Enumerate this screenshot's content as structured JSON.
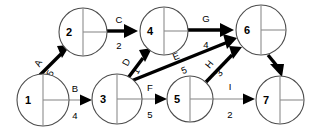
{
  "diagram": {
    "type": "directed-graph",
    "colors": {
      "background": "#ffffff",
      "node_stroke": "#4d4d4d",
      "node_fill": "#ffffff",
      "node_divider": "#8c8c8c",
      "edge_strong": "#000000",
      "edge_weak": "#b3b3b3",
      "text": "#000000"
    },
    "nodes": [
      {
        "id": "n1",
        "label": "1",
        "cx": 43,
        "cy": 100,
        "r": 26
      },
      {
        "id": "n2",
        "label": "2",
        "cx": 83,
        "cy": 32,
        "r": 24
      },
      {
        "id": "n3",
        "label": "3",
        "cx": 117,
        "cy": 99,
        "r": 25
      },
      {
        "id": "n4",
        "label": "4",
        "cx": 164,
        "cy": 31,
        "r": 24
      },
      {
        "id": "n5",
        "label": "5",
        "cx": 190,
        "cy": 99,
        "r": 23
      },
      {
        "id": "n6",
        "label": "6",
        "cx": 261,
        "cy": 30,
        "r": 25
      },
      {
        "id": "n7",
        "label": "7",
        "cx": 280,
        "cy": 100,
        "r": 24
      }
    ],
    "edges": [
      {
        "id": "e-a",
        "label": "A",
        "weight": "5",
        "from": "n1",
        "to": "n2",
        "emphasis": "strong"
      },
      {
        "id": "e-b",
        "label": "B",
        "weight": "4",
        "from": "n1",
        "to": "n3",
        "emphasis": "weak"
      },
      {
        "id": "e-c",
        "label": "C",
        "weight": "2",
        "from": "n2",
        "to": "n4",
        "emphasis": "strong"
      },
      {
        "id": "e-d",
        "label": "D",
        "weight": "1",
        "from": "n3",
        "to": "n4",
        "emphasis": "strong"
      },
      {
        "id": "e-e",
        "label": "E",
        "weight": "5",
        "from": "n3",
        "to": "n6",
        "emphasis": "strong"
      },
      {
        "id": "e-f",
        "label": "F",
        "weight": "5",
        "from": "n3",
        "to": "n5",
        "emphasis": "weak"
      },
      {
        "id": "e-g",
        "label": "G",
        "weight": "4",
        "from": "n4",
        "to": "n6",
        "emphasis": "strong"
      },
      {
        "id": "e-h",
        "label": "H",
        "weight": "3",
        "from": "n5",
        "to": "n6",
        "emphasis": "strong"
      },
      {
        "id": "e-i",
        "label": "I",
        "weight": "2",
        "from": "n5",
        "to": "n7",
        "emphasis": "weak"
      },
      {
        "id": "e-j",
        "label": "",
        "weight": "",
        "from": "n6",
        "to": "n7",
        "emphasis": "strong"
      }
    ]
  }
}
